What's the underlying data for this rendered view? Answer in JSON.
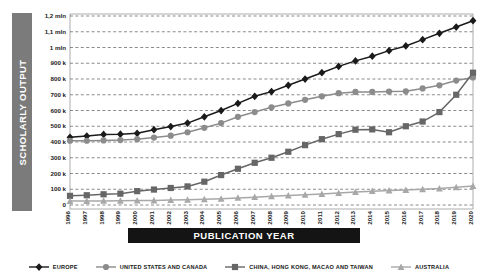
{
  "axis_titles": {
    "y": "SCHOLARLY OUTPUT",
    "x": "PUBLICATION YEAR"
  },
  "colors": {
    "europe": "#1a1a1a",
    "us_canada": "#8c8c8c",
    "china": "#666666",
    "australia": "#a8a8a8",
    "ylabel_bar": "#7b7b7b",
    "xlabel_bar": "#141414",
    "gridline": "#5a5a5a",
    "plot_border": "#9a9a9a"
  },
  "legend": [
    {
      "label": "EUROPE",
      "marker": "diamond",
      "color": "#1a1a1a"
    },
    {
      "label": "UNITED STATES AND CANADA",
      "marker": "circle",
      "color": "#8c8c8c"
    },
    {
      "label": "CHINA, HONG KONG, MACAO AND TAIWAN",
      "marker": "square",
      "color": "#666666"
    },
    {
      "label": "AUSTRALIA",
      "marker": "triangle",
      "color": "#a8a8a8"
    }
  ],
  "chart_data": {
    "type": "line",
    "title": "",
    "xlabel": "PUBLICATION YEAR",
    "ylabel": "SCHOLARLY OUTPUT",
    "xlim": [
      1996,
      2020
    ],
    "ylim": [
      0,
      1200000
    ],
    "grid": true,
    "legend_position": "bottom",
    "x": [
      1996,
      1997,
      1998,
      1999,
      2000,
      2001,
      2002,
      2003,
      2004,
      2005,
      2006,
      2007,
      2008,
      2009,
      2010,
      2011,
      2012,
      2013,
      2014,
      2015,
      2016,
      2017,
      2018,
      2019,
      2020
    ],
    "categories": [
      "1996",
      "1997",
      "1998",
      "1999",
      "2000",
      "2001",
      "2002",
      "2003",
      "2004",
      "2005",
      "2006",
      "2007",
      "2008",
      "2009",
      "2010",
      "2011",
      "2012",
      "2013",
      "2014",
      "2015",
      "2016",
      "2017",
      "2018",
      "2019",
      "2020"
    ],
    "ytick_labels": [
      "0",
      "100 k",
      "200 k",
      "300 k",
      "400 k",
      "500 k",
      "600 k",
      "700 k",
      "800 k",
      "900 k",
      "1 mln",
      "1,1 mln",
      "1,2 mln"
    ],
    "ytick_values": [
      0,
      100000,
      200000,
      300000,
      400000,
      500000,
      600000,
      700000,
      800000,
      900000,
      1000000,
      1100000,
      1200000
    ],
    "series": [
      {
        "name": "EUROPE",
        "marker": "diamond",
        "color": "#1a1a1a",
        "values": [
          430000,
          438000,
          448000,
          450000,
          455000,
          478000,
          498000,
          520000,
          560000,
          600000,
          645000,
          690000,
          720000,
          760000,
          800000,
          840000,
          880000,
          915000,
          945000,
          980000,
          1010000,
          1050000,
          1090000,
          1130000,
          1170000
        ]
      },
      {
        "name": "UNITED STATES AND CANADA",
        "marker": "circle",
        "color": "#8c8c8c",
        "values": [
          408000,
          408000,
          410000,
          412000,
          418000,
          428000,
          440000,
          462000,
          490000,
          520000,
          560000,
          590000,
          620000,
          645000,
          668000,
          690000,
          710000,
          718000,
          718000,
          720000,
          722000,
          740000,
          760000,
          790000,
          810000
        ]
      },
      {
        "name": "CHINA, HONG KONG, MACAO AND TAIWAN",
        "marker": "square",
        "color": "#666666",
        "values": [
          58000,
          62000,
          68000,
          72000,
          88000,
          98000,
          108000,
          118000,
          148000,
          190000,
          230000,
          268000,
          300000,
          338000,
          380000,
          418000,
          450000,
          478000,
          480000,
          462000,
          500000,
          530000,
          590000,
          700000,
          840000
        ]
      },
      {
        "name": "AUSTRALIA",
        "marker": "triangle",
        "color": "#a8a8a8",
        "values": [
          25000,
          25000,
          26000,
          27000,
          28000,
          29000,
          31000,
          33000,
          36000,
          40000,
          45000,
          50000,
          55000,
          60000,
          65000,
          70000,
          76000,
          82000,
          88000,
          92000,
          95000,
          100000,
          105000,
          112000,
          120000
        ]
      }
    ]
  }
}
